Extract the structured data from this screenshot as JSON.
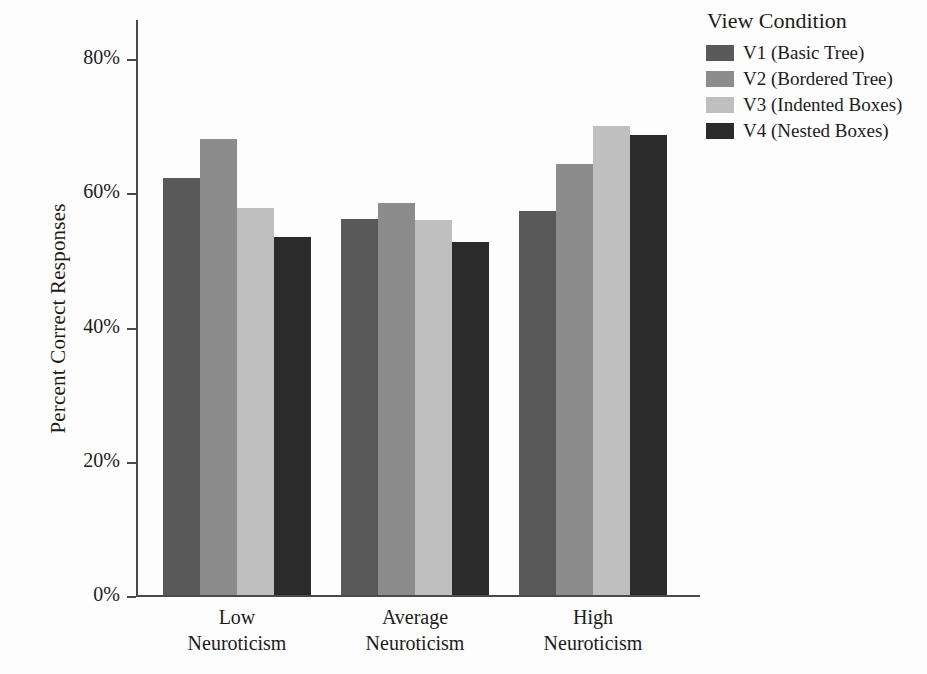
{
  "chart_data": {
    "type": "bar",
    "title": "",
    "xlabel": "",
    "ylabel": "Percent Correct Responses",
    "categories": [
      "Low\nNeuroticism",
      "Average\nNeuroticism",
      "High\nNeuroticism"
    ],
    "category_lines": [
      [
        "Low",
        "Neuroticism"
      ],
      [
        "Average",
        "Neuroticism"
      ],
      [
        "High",
        "Neuroticism"
      ]
    ],
    "series": [
      {
        "name": "V1 (Basic Tree)",
        "color": "#595959",
        "values": [
          62.1,
          56.0,
          57.3
        ]
      },
      {
        "name": "V2 (Bordered Tree)",
        "color": "#8c8c8c",
        "values": [
          68.0,
          58.5,
          64.2
        ]
      },
      {
        "name": "V3 (Indented Boxes)",
        "color": "#bfbfbf",
        "values": [
          57.7,
          55.9,
          69.9
        ]
      },
      {
        "name": "V4 (Nested Boxes)",
        "color": "#2b2b2b",
        "values": [
          53.3,
          52.6,
          68.6
        ]
      }
    ],
    "ylim": [
      0,
      86
    ],
    "yticks": [
      0,
      20,
      40,
      60,
      80
    ],
    "ytick_labels": [
      "0%",
      "20%",
      "40%",
      "60%",
      "80%"
    ],
    "grid": false,
    "legend_position": "top-right",
    "legend_title": "View Condition"
  },
  "legend": {
    "title": "View Condition",
    "entries": [
      {
        "label": "V1 (Basic Tree)",
        "color": "#595959"
      },
      {
        "label": "V2 (Bordered Tree)",
        "color": "#8c8c8c"
      },
      {
        "label": "V3 (Indented Boxes)",
        "color": "#bfbfbf"
      },
      {
        "label": "V4 (Nested Boxes)",
        "color": "#2b2b2b"
      }
    ]
  },
  "axes": {
    "y_title": "Percent Correct Responses",
    "y_tick_labels": [
      "80%",
      "60%",
      "40%",
      "20%",
      "0%"
    ],
    "x_category_labels": [
      {
        "line1": "Low",
        "line2": "Neuroticism"
      },
      {
        "line1": "Average",
        "line2": "Neuroticism"
      },
      {
        "line1": "High",
        "line2": "Neuroticism"
      }
    ]
  },
  "colors": {
    "axis": "#4a4a4a",
    "text": "#1c1c1c",
    "background": "#fdfdfd"
  }
}
